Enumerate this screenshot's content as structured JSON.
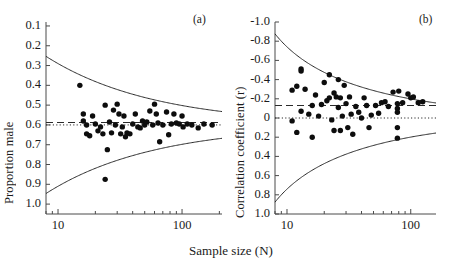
{
  "figure": {
    "xlabel": "Sample size (N)",
    "panels": [
      {
        "tag": "(a)",
        "ylabel": "Proportion male",
        "ytick_labels": [
          "1.0",
          "0.9",
          "0.8",
          "0.7",
          "0.6",
          "0.5",
          "0.4",
          "0.3",
          "0.2",
          "0.1"
        ],
        "xtick_labels": [
          "10",
          "100"
        ]
      },
      {
        "tag": "(b)",
        "ylabel": "Correlation coefficient (r)",
        "ytick_labels": [
          "1.0",
          "0.8",
          "0.6",
          "0.4",
          "0.2",
          "0",
          "-0.2",
          "-0.4",
          "-0.6",
          "-0.8",
          "-1.0"
        ],
        "xtick_labels": [
          "10",
          "100"
        ]
      }
    ]
  },
  "chart_data": [
    {
      "type": "scatter",
      "title": "(a)",
      "xlabel": "Sample size (N)",
      "ylabel": "Proportion male",
      "xscale": "log",
      "xlim": [
        8,
        210
      ],
      "ylim": [
        0.05,
        1.02
      ],
      "xticks_labeled": [
        10,
        100
      ],
      "yticks": [
        0.1,
        0.2,
        0.3,
        0.4,
        0.5,
        0.6,
        0.7,
        0.8,
        0.9,
        1.0
      ],
      "grid": false,
      "legend": "none",
      "reference_lines": [
        {
          "name": "null-expectation",
          "style": "dotted",
          "y": 0.5
        },
        {
          "name": "meta-analytic-mean",
          "style": "dashed",
          "y": 0.512
        }
      ],
      "funnel": {
        "center": 0.5,
        "style": "solid",
        "description": "95% pseudo-confidence funnel, half-width = 1.96*sqrt(0.25/N)"
      },
      "points": [
        {
          "x": 15,
          "y": 0.7
        },
        {
          "x": 16,
          "y": 0.555
        },
        {
          "x": 16,
          "y": 0.52
        },
        {
          "x": 17,
          "y": 0.455
        },
        {
          "x": 17,
          "y": 0.5
        },
        {
          "x": 18,
          "y": 0.445
        },
        {
          "x": 19,
          "y": 0.545
        },
        {
          "x": 20,
          "y": 0.505
        },
        {
          "x": 21,
          "y": 0.47
        },
        {
          "x": 22,
          "y": 0.49
        },
        {
          "x": 23,
          "y": 0.455
        },
        {
          "x": 24,
          "y": 0.6
        },
        {
          "x": 24,
          "y": 0.225
        },
        {
          "x": 25,
          "y": 0.375
        },
        {
          "x": 26,
          "y": 0.515
        },
        {
          "x": 27,
          "y": 0.46
        },
        {
          "x": 28,
          "y": 0.575
        },
        {
          "x": 29,
          "y": 0.5
        },
        {
          "x": 30,
          "y": 0.605
        },
        {
          "x": 31,
          "y": 0.555
        },
        {
          "x": 32,
          "y": 0.455
        },
        {
          "x": 33,
          "y": 0.49
        },
        {
          "x": 34,
          "y": 0.545
        },
        {
          "x": 35,
          "y": 0.44
        },
        {
          "x": 36,
          "y": 0.46
        },
        {
          "x": 38,
          "y": 0.455
        },
        {
          "x": 40,
          "y": 0.505
        },
        {
          "x": 42,
          "y": 0.555
        },
        {
          "x": 44,
          "y": 0.49
        },
        {
          "x": 46,
          "y": 0.485
        },
        {
          "x": 48,
          "y": 0.52
        },
        {
          "x": 50,
          "y": 0.5
        },
        {
          "x": 52,
          "y": 0.515
        },
        {
          "x": 55,
          "y": 0.57
        },
        {
          "x": 58,
          "y": 0.5
        },
        {
          "x": 60,
          "y": 0.605
        },
        {
          "x": 62,
          "y": 0.555
        },
        {
          "x": 64,
          "y": 0.51
        },
        {
          "x": 66,
          "y": 0.415
        },
        {
          "x": 70,
          "y": 0.5
        },
        {
          "x": 75,
          "y": 0.565
        },
        {
          "x": 78,
          "y": 0.45
        },
        {
          "x": 82,
          "y": 0.505
        },
        {
          "x": 86,
          "y": 0.555
        },
        {
          "x": 90,
          "y": 0.51
        },
        {
          "x": 95,
          "y": 0.505
        },
        {
          "x": 100,
          "y": 0.545
        },
        {
          "x": 102,
          "y": 0.49
        },
        {
          "x": 110,
          "y": 0.505
        },
        {
          "x": 120,
          "y": 0.5
        },
        {
          "x": 135,
          "y": 0.485
        },
        {
          "x": 150,
          "y": 0.505
        },
        {
          "x": 175,
          "y": 0.5
        }
      ]
    },
    {
      "type": "scatter",
      "title": "(b)",
      "xlabel": "Sample size (N)",
      "ylabel": "Correlation coefficient (r)",
      "xscale": "log",
      "xlim": [
        8,
        160
      ],
      "ylim": [
        -1.0,
        1.0
      ],
      "xticks_labeled": [
        10,
        100
      ],
      "yticks": [
        -1.0,
        -0.8,
        -0.6,
        -0.4,
        -0.2,
        0,
        0.2,
        0.4,
        0.6,
        0.8,
        1.0
      ],
      "grid": false,
      "legend": "none",
      "reference_lines": [
        {
          "name": "zero-effect",
          "style": "dotted",
          "y": 0
        },
        {
          "name": "meta-analytic-mean",
          "style": "dashed",
          "y": 0.13
        }
      ],
      "funnel": {
        "center": 0.0,
        "style": "solid",
        "description": "95% pseudo-confidence funnel, half-width = 1.96/sqrt(N-3)"
      },
      "points": [
        {
          "x": 11,
          "y": 0.29
        },
        {
          "x": 11,
          "y": -0.03
        },
        {
          "x": 12,
          "y": 0.33
        },
        {
          "x": 12,
          "y": -0.15
        },
        {
          "x": 13,
          "y": 0.51
        },
        {
          "x": 13,
          "y": 0.49
        },
        {
          "x": 13,
          "y": 0.07
        },
        {
          "x": 14,
          "y": 0.3
        },
        {
          "x": 15,
          "y": 0.04
        },
        {
          "x": 16,
          "y": 0.13
        },
        {
          "x": 16,
          "y": -0.2
        },
        {
          "x": 17,
          "y": 0.24
        },
        {
          "x": 18,
          "y": 0.02
        },
        {
          "x": 19,
          "y": 0.14
        },
        {
          "x": 20,
          "y": 0.37
        },
        {
          "x": 21,
          "y": 0.18
        },
        {
          "x": 22,
          "y": 0.45
        },
        {
          "x": 22,
          "y": 0.21
        },
        {
          "x": 23,
          "y": -0.02
        },
        {
          "x": 24,
          "y": 0.26
        },
        {
          "x": 24,
          "y": -0.13
        },
        {
          "x": 25,
          "y": 0.22
        },
        {
          "x": 26,
          "y": 0.4
        },
        {
          "x": 26,
          "y": 0.11
        },
        {
          "x": 27,
          "y": 0.21
        },
        {
          "x": 27,
          "y": -0.13
        },
        {
          "x": 28,
          "y": 0.02
        },
        {
          "x": 29,
          "y": 0.34
        },
        {
          "x": 30,
          "y": 0.15
        },
        {
          "x": 31,
          "y": -0.1
        },
        {
          "x": 32,
          "y": 0.22
        },
        {
          "x": 33,
          "y": 0.04
        },
        {
          "x": 34,
          "y": -0.17
        },
        {
          "x": 36,
          "y": 0.12
        },
        {
          "x": 38,
          "y": 0.06
        },
        {
          "x": 40,
          "y": 0.0
        },
        {
          "x": 42,
          "y": 0.21
        },
        {
          "x": 44,
          "y": 0.13
        },
        {
          "x": 46,
          "y": -0.1
        },
        {
          "x": 48,
          "y": 0.03
        },
        {
          "x": 52,
          "y": 0.13
        },
        {
          "x": 55,
          "y": 0.05
        },
        {
          "x": 58,
          "y": 0.16
        },
        {
          "x": 62,
          "y": 0.17
        },
        {
          "x": 66,
          "y": 0.12
        },
        {
          "x": 72,
          "y": 0.27
        },
        {
          "x": 78,
          "y": 0.15
        },
        {
          "x": 78,
          "y": 0.1
        },
        {
          "x": 78,
          "y": 0.06
        },
        {
          "x": 78,
          "y": -0.1
        },
        {
          "x": 78,
          "y": -0.21
        },
        {
          "x": 80,
          "y": 0.28
        },
        {
          "x": 86,
          "y": 0.16
        },
        {
          "x": 95,
          "y": 0.25
        },
        {
          "x": 100,
          "y": 0.21
        },
        {
          "x": 105,
          "y": 0.22
        },
        {
          "x": 115,
          "y": 0.16
        },
        {
          "x": 125,
          "y": 0.17
        }
      ]
    }
  ]
}
